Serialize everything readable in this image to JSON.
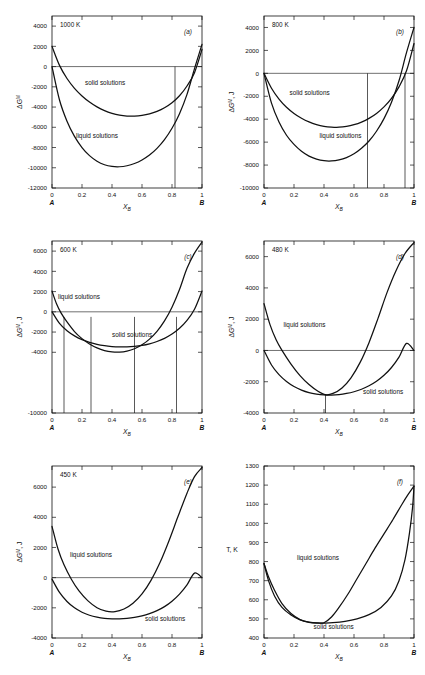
{
  "figure": {
    "x_axis_symbol": "X",
    "x_axis_sub": "B",
    "left_end_label": "A",
    "right_end_label": "B",
    "x_ticks": [
      "0",
      "0.2",
      "0.4",
      "0.6",
      "0.8",
      "1"
    ],
    "liquid_label": "liquid solutions",
    "solid_label": "solid solutions",
    "gibbs_axis_symbol": "ΔG",
    "gibbs_axis_sup": "M",
    "gibbs_axis_unit": "J",
    "temp_axis_label": "T, K"
  },
  "chart_data": [
    {
      "type": "line",
      "panel_id": "(a)",
      "title": "1000 K",
      "temperature_K": 1000,
      "xlabel": "X_B",
      "ylabel": "ΔG^M",
      "ylim": [
        -12000,
        5000
      ],
      "xlim": [
        0,
        1
      ],
      "y_ticks": [
        "4000",
        "2000",
        "0",
        "-2000",
        "-4000",
        "-6000",
        "-8000",
        "-10000",
        "-12000"
      ],
      "y_tick_values": [
        4000,
        2000,
        0,
        -2000,
        -4000,
        -6000,
        -8000,
        -10000,
        -12000
      ],
      "grid": false,
      "zero_line": true,
      "series": [
        {
          "name": "solid solutions",
          "x": [
            0.0,
            0.05,
            0.1,
            0.15,
            0.2,
            0.25,
            0.3,
            0.35,
            0.4,
            0.45,
            0.5,
            0.55,
            0.6,
            0.65,
            0.7,
            0.75,
            0.8,
            0.85,
            0.9,
            0.95,
            1.0
          ],
          "values": [
            2000,
            120,
            -1180,
            -2150,
            -2900,
            -3500,
            -3980,
            -4350,
            -4620,
            -4800,
            -4890,
            -4900,
            -4830,
            -4680,
            -4430,
            -4070,
            -3570,
            -2880,
            -1920,
            -600,
            1700
          ]
        },
        {
          "name": "liquid solutions",
          "x": [
            0.0,
            0.05,
            0.1,
            0.15,
            0.2,
            0.25,
            0.3,
            0.35,
            0.4,
            0.45,
            0.5,
            0.55,
            0.6,
            0.65,
            0.7,
            0.75,
            0.8,
            0.85,
            0.9,
            0.95,
            1.0
          ],
          "values": [
            0,
            -3300,
            -5400,
            -6900,
            -8000,
            -8800,
            -9350,
            -9700,
            -9870,
            -9900,
            -9800,
            -9580,
            -9230,
            -8740,
            -8080,
            -7220,
            -6100,
            -4650,
            -2750,
            -200,
            2200
          ]
        }
      ],
      "tie_lines_x": [
        0.82
      ],
      "label_positions": {
        "solid": {
          "x": 0.22,
          "y": -1800
        },
        "liquid": {
          "x": 0.16,
          "y": -7100
        }
      }
    },
    {
      "type": "line",
      "panel_id": "(b)",
      "title": "800 K",
      "temperature_K": 800,
      "xlabel": "X_B",
      "ylabel": "ΔG^M, J",
      "ylim": [
        -10000,
        5000
      ],
      "xlim": [
        0,
        1
      ],
      "y_ticks": [
        "4000",
        "2000",
        "0",
        "-2000",
        "-4000",
        "-6000",
        "-8000",
        "-10000"
      ],
      "y_tick_values": [
        4000,
        2000,
        0,
        -2000,
        -4000,
        -6000,
        -8000,
        -10000
      ],
      "grid": false,
      "zero_line": true,
      "series": [
        {
          "name": "solid solutions",
          "x": [
            0.0,
            0.05,
            0.1,
            0.15,
            0.2,
            0.25,
            0.3,
            0.35,
            0.4,
            0.45,
            0.5,
            0.55,
            0.6,
            0.65,
            0.7,
            0.75,
            0.8,
            0.85,
            0.9,
            0.95,
            1.0
          ],
          "values": [
            0,
            -1300,
            -2250,
            -2960,
            -3500,
            -3920,
            -4240,
            -4470,
            -4620,
            -4690,
            -4700,
            -4630,
            -4480,
            -4250,
            -3930,
            -3500,
            -2930,
            -2180,
            -1180,
            220,
            2600
          ]
        },
        {
          "name": "liquid solutions",
          "x": [
            0.0,
            0.05,
            0.1,
            0.15,
            0.2,
            0.25,
            0.3,
            0.35,
            0.4,
            0.45,
            0.5,
            0.55,
            0.6,
            0.65,
            0.7,
            0.75,
            0.8,
            0.85,
            0.9,
            0.95,
            1.0
          ],
          "values": [
            0,
            -2600,
            -4250,
            -5400,
            -6200,
            -6800,
            -7220,
            -7480,
            -7620,
            -7640,
            -7550,
            -7350,
            -7020,
            -6540,
            -5900,
            -5050,
            -3950,
            -2520,
            -650,
            1800,
            4000
          ]
        }
      ],
      "tie_lines_x": [
        0.69,
        0.94
      ],
      "label_positions": {
        "solid": {
          "x": 0.17,
          "y": -1900
        },
        "liquid": {
          "x": 0.37,
          "y": -5600
        }
      }
    },
    {
      "type": "line",
      "panel_id": "(c)",
      "title": "600 K",
      "temperature_K": 600,
      "xlabel": "X_B",
      "ylabel": "ΔG^M, J",
      "ylim": [
        -10000,
        7000
      ],
      "xlim": [
        0,
        1
      ],
      "y_ticks": [
        "6000",
        "4000",
        "2000",
        "0",
        "-2000",
        "-4000",
        "-10000"
      ],
      "y_tick_values": [
        6000,
        4000,
        2000,
        0,
        -2000,
        -4000,
        -10000
      ],
      "grid": false,
      "zero_line": true,
      "series": [
        {
          "name": "solid solutions",
          "x": [
            0.0,
            0.05,
            0.1,
            0.15,
            0.2,
            0.25,
            0.3,
            0.35,
            0.4,
            0.45,
            0.5,
            0.55,
            0.6,
            0.65,
            0.7,
            0.75,
            0.8,
            0.85,
            0.9,
            0.95,
            1.0
          ],
          "values": [
            0,
            -1150,
            -1880,
            -2380,
            -2750,
            -3020,
            -3220,
            -3350,
            -3430,
            -3470,
            -3470,
            -3420,
            -3320,
            -3160,
            -2930,
            -2620,
            -2200,
            -1630,
            -850,
            250,
            2050
          ]
        },
        {
          "name": "liquid solutions",
          "x": [
            0.0,
            0.03,
            0.06,
            0.1,
            0.15,
            0.2,
            0.25,
            0.3,
            0.35,
            0.4,
            0.45,
            0.5,
            0.55,
            0.6,
            0.65,
            0.7,
            0.75,
            0.8,
            0.85,
            0.9,
            0.95,
            1.0
          ],
          "values": [
            2050,
            800,
            -100,
            -1000,
            -1950,
            -2650,
            -3180,
            -3570,
            -3830,
            -3960,
            -3980,
            -3880,
            -3650,
            -3260,
            -2700,
            -1930,
            -900,
            450,
            2200,
            4300,
            5800,
            6900
          ]
        }
      ],
      "tie_lines_x": [
        0.08,
        0.26,
        0.55,
        0.83
      ],
      "label_positions": {
        "solid": {
          "x": 0.4,
          "y": -2450
        },
        "liquid": {
          "x": 0.04,
          "y": 1300
        }
      }
    },
    {
      "type": "line",
      "panel_id": "(d)",
      "title": "480 K",
      "temperature_K": 480,
      "xlabel": "X_B",
      "ylabel": "ΔG^M, J",
      "ylim": [
        -4000,
        7000
      ],
      "xlim": [
        0,
        1
      ],
      "y_ticks": [
        "6000",
        "4000",
        "2000",
        "0",
        "-2000",
        "-4000"
      ],
      "y_tick_values": [
        6000,
        4000,
        2000,
        0,
        -2000,
        -4000
      ],
      "grid": false,
      "zero_line": true,
      "series": [
        {
          "name": "solid solutions",
          "x": [
            0.0,
            0.05,
            0.1,
            0.15,
            0.2,
            0.25,
            0.3,
            0.35,
            0.4,
            0.45,
            0.5,
            0.55,
            0.6,
            0.65,
            0.7,
            0.75,
            0.8,
            0.85,
            0.9,
            0.95,
            1.0
          ],
          "values": [
            0,
            -930,
            -1550,
            -1990,
            -2310,
            -2540,
            -2700,
            -2790,
            -2840,
            -2850,
            -2820,
            -2750,
            -2640,
            -2480,
            -2260,
            -1970,
            -1590,
            -1090,
            -430,
            450,
            0
          ]
        },
        {
          "name": "liquid solutions",
          "x": [
            0.0,
            0.04,
            0.08,
            0.12,
            0.18,
            0.24,
            0.3,
            0.36,
            0.41,
            0.46,
            0.52,
            0.58,
            0.64,
            0.7,
            0.76,
            0.82,
            0.88,
            0.94,
            1.0
          ],
          "values": [
            3000,
            1650,
            700,
            0,
            -870,
            -1610,
            -2180,
            -2610,
            -2830,
            -2750,
            -2400,
            -1750,
            -780,
            500,
            2050,
            3700,
            5100,
            6200,
            6900
          ]
        }
      ],
      "tie_lines_x": [
        0.41
      ],
      "label_positions": {
        "solid": {
          "x": 0.66,
          "y": -2780
        },
        "liquid": {
          "x": 0.13,
          "y": 1500
        }
      }
    },
    {
      "type": "line",
      "panel_id": "(e)",
      "title": "450 K",
      "temperature_K": 450,
      "xlabel": "X_B",
      "ylabel": "ΔG^M, J",
      "ylim": [
        -4000,
        7400
      ],
      "xlim": [
        0,
        1
      ],
      "y_ticks": [
        "6000",
        "4000",
        "2000",
        "0",
        "-2000",
        "-4000"
      ],
      "y_tick_values": [
        6000,
        4000,
        2000,
        0,
        -2000,
        -4000
      ],
      "grid": false,
      "zero_line": true,
      "series": [
        {
          "name": "solid solutions",
          "x": [
            0.0,
            0.05,
            0.1,
            0.15,
            0.2,
            0.25,
            0.3,
            0.35,
            0.4,
            0.45,
            0.5,
            0.55,
            0.6,
            0.65,
            0.7,
            0.75,
            0.8,
            0.85,
            0.9,
            0.95,
            1.0
          ],
          "values": [
            -100,
            -980,
            -1580,
            -2000,
            -2290,
            -2490,
            -2620,
            -2700,
            -2730,
            -2730,
            -2700,
            -2640,
            -2540,
            -2390,
            -2190,
            -1920,
            -1560,
            -1090,
            -480,
            300,
            0
          ]
        },
        {
          "name": "liquid solutions",
          "x": [
            0.0,
            0.04,
            0.08,
            0.13,
            0.18,
            0.24,
            0.3,
            0.36,
            0.42,
            0.48,
            0.54,
            0.6,
            0.66,
            0.72,
            0.78,
            0.84,
            0.9,
            0.95,
            1.0
          ],
          "values": [
            3400,
            1900,
            850,
            -120,
            -880,
            -1540,
            -1990,
            -2220,
            -2250,
            -2080,
            -1700,
            -1080,
            -180,
            1000,
            2450,
            4050,
            5600,
            6700,
            7300
          ]
        }
      ],
      "tie_lines_x": [],
      "label_positions": {
        "solid": {
          "x": 0.62,
          "y": -2900
        },
        "liquid": {
          "x": 0.12,
          "y": 1350
        }
      }
    },
    {
      "type": "line",
      "panel_id": "(f)",
      "title": "",
      "xlabel": "X_B",
      "ylabel": "T, K",
      "ylim": [
        400,
        1300
      ],
      "xlim": [
        0,
        1
      ],
      "y_ticks": [
        "1300",
        "1200",
        "1100",
        "1000",
        "900",
        "800",
        "700",
        "600",
        "500",
        "400"
      ],
      "y_tick_values": [
        1300,
        1200,
        1100,
        1000,
        900,
        800,
        700,
        600,
        500,
        400
      ],
      "grid": false,
      "zero_line": false,
      "series": [
        {
          "name": "liquidus",
          "x": [
            0.0,
            0.03,
            0.07,
            0.12,
            0.18,
            0.24,
            0.3,
            0.36,
            0.4,
            0.45,
            0.5,
            0.56,
            0.62,
            0.68,
            0.74,
            0.8,
            0.86,
            0.92,
            0.96,
            1.0
          ],
          "values": [
            790,
            700,
            620,
            560,
            520,
            495,
            483,
            479,
            480,
            510,
            560,
            630,
            710,
            790,
            870,
            945,
            1020,
            1100,
            1150,
            1195
          ]
        },
        {
          "name": "solidus",
          "x": [
            0.0,
            0.03,
            0.07,
            0.12,
            0.18,
            0.24,
            0.3,
            0.36,
            0.4,
            0.46,
            0.54,
            0.62,
            0.7,
            0.78,
            0.85,
            0.9,
            0.94,
            0.97,
            0.99,
            1.0
          ],
          "values": [
            790,
            720,
            650,
            580,
            528,
            497,
            482,
            478,
            478,
            480,
            487,
            500,
            522,
            560,
            620,
            700,
            810,
            950,
            1080,
            1195
          ]
        }
      ],
      "tie_lines_x": [],
      "label_positions": {
        "solid": {
          "x": 0.33,
          "y": 447
        },
        "liquid": {
          "x": 0.22,
          "y": 810
        }
      }
    }
  ]
}
